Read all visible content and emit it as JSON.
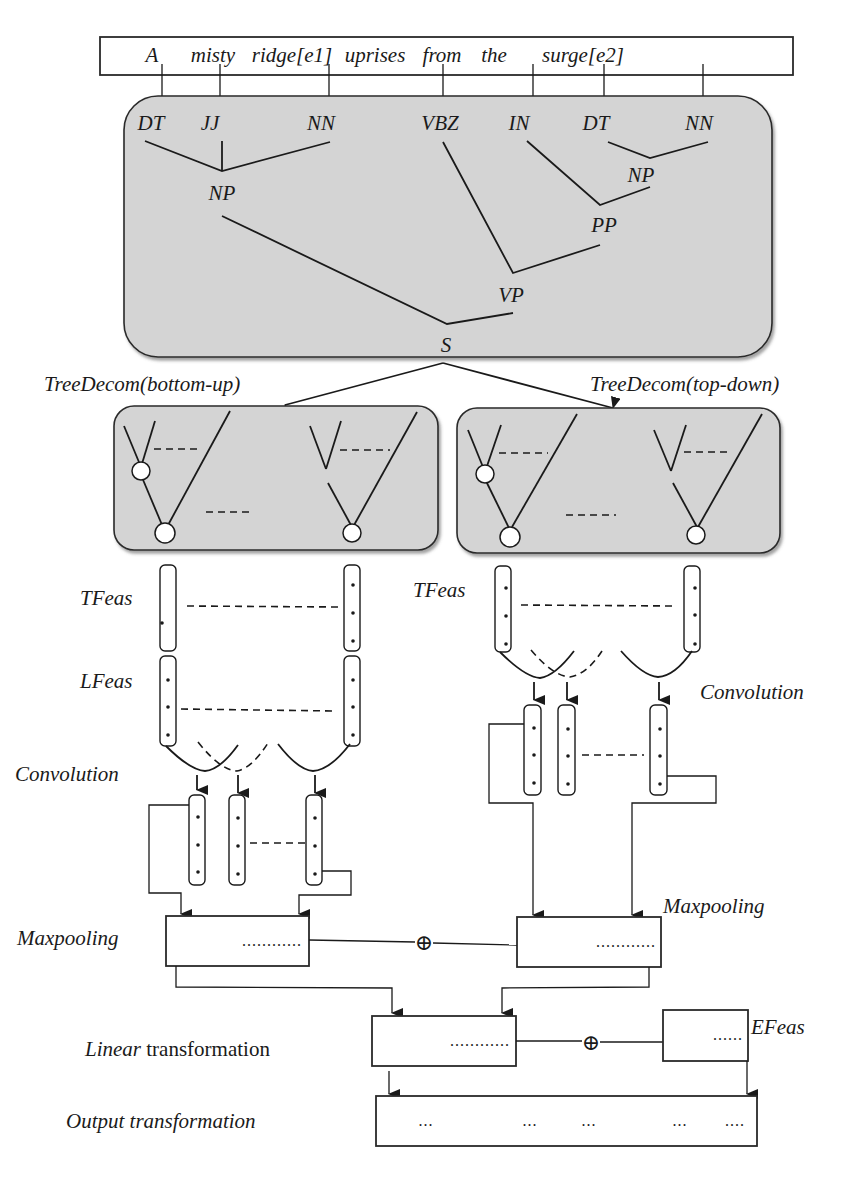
{
  "sentence": {
    "words": [
      {
        "text": "A",
        "x": 152
      },
      {
        "text": "misty",
        "x": 213
      },
      {
        "text": "ridge[e1]",
        "x": 292
      },
      {
        "text": "uprises",
        "x": 375
      },
      {
        "text": "from",
        "x": 442
      },
      {
        "text": "the",
        "x": 494
      },
      {
        "text": "surge[e2]",
        "x": 583
      }
    ]
  },
  "parse_tree": {
    "pos_tags": [
      {
        "text": "DT",
        "x": 150
      },
      {
        "text": "JJ",
        "x": 210
      },
      {
        "text": "NN",
        "x": 320
      },
      {
        "text": "VBZ",
        "x": 440
      },
      {
        "text": "IN",
        "x": 523
      },
      {
        "text": "DT",
        "x": 600
      },
      {
        "text": "NN",
        "x": 707
      }
    ],
    "phrase_nodes": {
      "np_left": "NP",
      "np_right": "NP",
      "pp": "PP",
      "vp": "VP",
      "s": "S"
    }
  },
  "decomposition": {
    "bottom_up_label": "TreeDecom(bottom-up)",
    "top_down_label": "TreeDecom(top-down)"
  },
  "left_branch": {
    "tfeas_label": "TFeas",
    "lfeas_label": "LFeas",
    "convolution_label": "Convolution",
    "maxpooling_label": "Maxpooling",
    "maxpool_dots": "............"
  },
  "right_branch": {
    "tfeas_label": "TFeas",
    "convolution_label": "Convolution",
    "maxpooling_label": "Maxpooling",
    "maxpool_dots": "............"
  },
  "merge": {
    "concat_symbol": "⊕",
    "linear_label_italic": "Linear",
    "linear_label_rest": " transformation",
    "linear_dots": "............",
    "efeas_label": "EFeas",
    "efeas_dots": "......",
    "output_label": "Output transformation",
    "output_dots": [
      "...",
      "...",
      "...",
      "...",
      "...."
    ]
  }
}
